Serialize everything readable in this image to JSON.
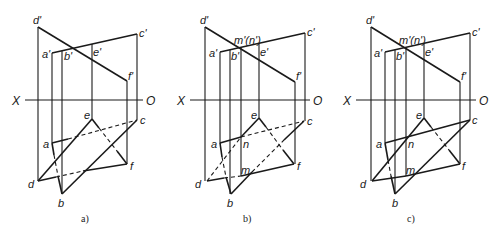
{
  "figure": {
    "axis": {
      "x_label": "X",
      "o_label": "O"
    },
    "panels": [
      {
        "id": "a",
        "caption": "a)",
        "labels": {
          "d_prime": "d'",
          "c_prime": "c'",
          "a_prime": "a'",
          "b_prime": "b'",
          "e_prime": "e'",
          "f_prime": "f'",
          "e": "e",
          "c": "c",
          "a": "a",
          "f": "f",
          "d": "d",
          "b": "b"
        }
      },
      {
        "id": "b",
        "caption": "b)",
        "labels": {
          "d_prime": "d'",
          "c_prime": "c'",
          "a_prime": "a'",
          "b_prime": "b'",
          "e_prime": "e'",
          "f_prime": "f'",
          "mn_prime": "m'(n')",
          "e": "e",
          "c": "c",
          "a": "a",
          "n": "n",
          "m": "m",
          "f": "f",
          "d": "d",
          "b": "b"
        }
      },
      {
        "id": "c",
        "caption": "c)",
        "labels": {
          "d_prime": "d'",
          "c_prime": "c'",
          "a_prime": "a'",
          "b_prime": "b'",
          "e_prime": "e'",
          "f_prime": "f'",
          "mn_prime": "m'(n')",
          "e": "e",
          "c": "c",
          "a": "a",
          "n": "n",
          "m": "m",
          "f": "f",
          "d": "d",
          "b": "b"
        }
      }
    ]
  }
}
